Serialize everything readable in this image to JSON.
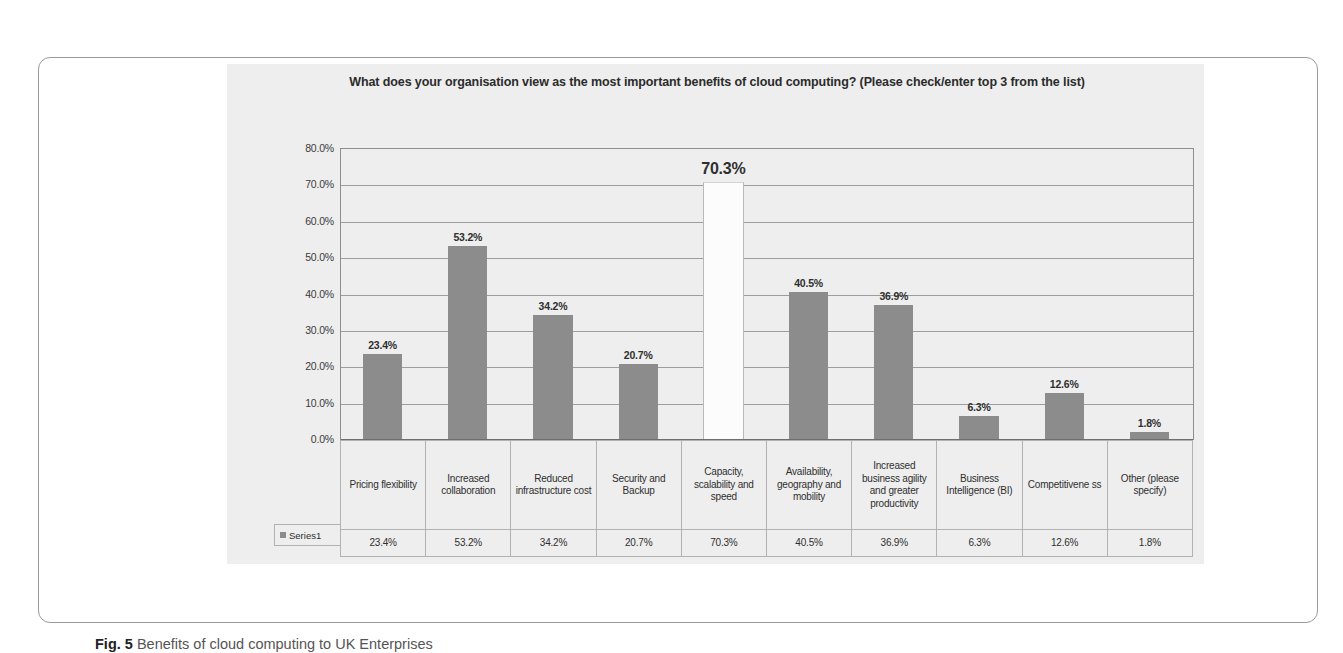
{
  "figure": {
    "caption_label": "Fig. 5",
    "caption_text": "Benefits of cloud computing to UK Enterprises"
  },
  "chart_data": {
    "type": "bar",
    "title": "What does your organisation view as the most important benefits of cloud computing? (Please check/enter top 3 from the list)",
    "xlabel": "",
    "ylabel": "",
    "ylim": [
      0,
      80
    ],
    "grid": true,
    "legend_position": "bottom-table",
    "y_tick_labels": [
      "80.0%",
      "70.0%",
      "60.0%",
      "50.0%",
      "40.0%",
      "30.0%",
      "20.0%",
      "10.0%",
      "0.0%"
    ],
    "y_ticks": [
      80,
      70,
      60,
      50,
      40,
      30,
      20,
      10,
      0
    ],
    "series_name": "Series1",
    "categories": [
      "Pricing flexibility",
      "Increased collaboration",
      "Reduced infrastructure cost",
      "Security and Backup",
      "Capacity, scalability and speed",
      "Availability, geography and mobility",
      "Increased business agility and greater productivity",
      "Business Intelligence (BI)",
      "Competitivene ss",
      "Other (please specify)"
    ],
    "values": [
      23.4,
      53.2,
      34.2,
      20.7,
      70.3,
      40.5,
      36.9,
      6.3,
      12.6,
      1.8
    ],
    "value_labels": [
      "23.4%",
      "53.2%",
      "34.2%",
      "20.7%",
      "70.3%",
      "40.5%",
      "36.9%",
      "6.3%",
      "12.6%",
      "1.8%"
    ],
    "highlighted_index": 4,
    "bar_color": "#8c8c8c",
    "highlight_bar_color": "#fcfcfc",
    "plot_background": "#eeeeee"
  }
}
